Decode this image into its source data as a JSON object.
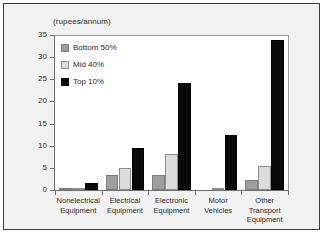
{
  "chart_data": {
    "type": "bar",
    "title": "",
    "subtitle": "",
    "units_label": "(rupees/annum)",
    "xlabel": "",
    "ylabel": "",
    "ylim": [
      0,
      35
    ],
    "yticks": [
      0,
      5,
      10,
      15,
      20,
      25,
      30,
      35
    ],
    "ytick_labels": [
      "0",
      "5",
      "10",
      "15",
      "20",
      "25",
      "30",
      "35"
    ],
    "grid": false,
    "legend_position": "top-left",
    "categories": [
      "Nonelectrical Equipment",
      "Electrical Equipment",
      "Electronic Equipment",
      "Motor Vehicles",
      "Other Transport Equipment"
    ],
    "category_lines": [
      [
        "Nonelectrical",
        "Equipment"
      ],
      [
        "Electrical",
        "Equipment"
      ],
      [
        "Electronic",
        "Equipment"
      ],
      [
        "Motor",
        "Vehicles"
      ],
      [
        "Other",
        "Transport",
        "Equipment"
      ]
    ],
    "series": [
      {
        "name": "Bottom 50%",
        "color": "#9e9e9e",
        "values": [
          0.05,
          3.3,
          3.5,
          0.0,
          2.3
        ]
      },
      {
        "name": "Mid 40%",
        "color": "#dcdcdc",
        "values": [
          0.3,
          5.0,
          8.1,
          0.05,
          5.4
        ]
      },
      {
        "name": "Top 10%",
        "color": "#0a0a0a",
        "values": [
          1.5,
          9.6,
          24.2,
          12.4,
          33.8
        ]
      }
    ]
  },
  "figure": {
    "background_color": "#f1f1f1",
    "plot_background_color": "#ffffff",
    "border_color": "#3c3c3c",
    "axis_color": "#6e6e6e",
    "text_color": "#2b2b2b"
  }
}
